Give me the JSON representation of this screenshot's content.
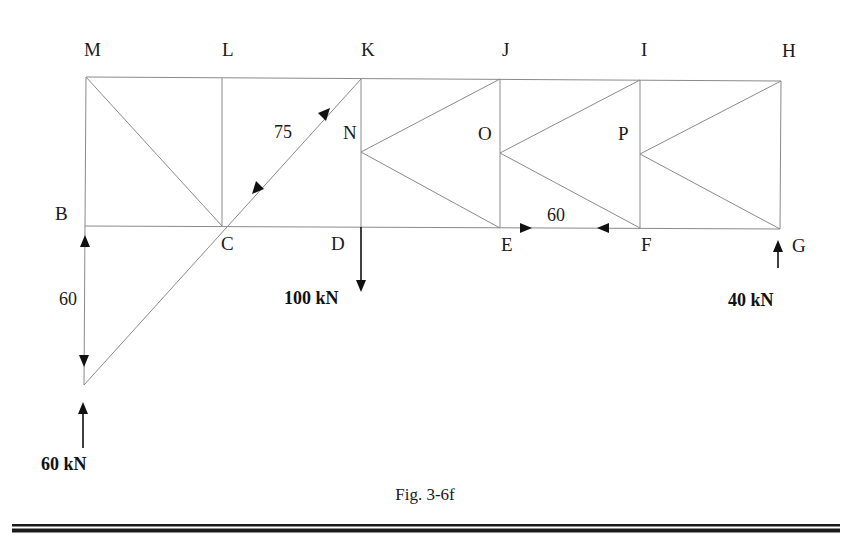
{
  "figure": {
    "caption": "Fig. 3-6f",
    "nodes": {
      "M": "M",
      "L": "L",
      "K": "K",
      "J": "J",
      "I": "I",
      "H": "H",
      "B": "B",
      "C": "C",
      "D": "D",
      "E": "E",
      "F": "F",
      "G": "G",
      "N": "N",
      "O": "O",
      "P": "P"
    },
    "member_forces": {
      "CK": "75",
      "EF": "60",
      "B_vertical": "60"
    },
    "loads": {
      "left_support": "60 kN",
      "D_load": "100 kN",
      "G_support": "40 kN"
    }
  }
}
